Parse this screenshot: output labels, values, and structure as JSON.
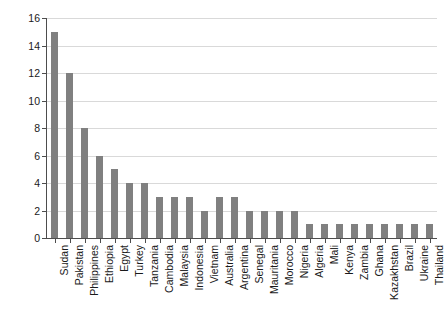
{
  "chart_data": {
    "type": "bar",
    "title": "",
    "subtitle": "",
    "xlabel": "",
    "ylabel": "",
    "ylim": [
      0,
      16
    ],
    "ytick_labels": [
      "0",
      "2",
      "4",
      "6",
      "8",
      "10",
      "12",
      "14",
      "16"
    ],
    "yticks": [
      0,
      2,
      4,
      6,
      8,
      10,
      12,
      14,
      16
    ],
    "grid": true,
    "legend": "none",
    "bar_color": "#808080",
    "axis_color": "#4d4d4d",
    "gridline_color": "#d9d9d9",
    "background_color": "#ffffff",
    "categories": [
      "Sudan",
      "Pakistan",
      "Philippines",
      "Ethiopia",
      "Egypt",
      "Turkey",
      "Tanzania",
      "Cambodia",
      "Malaysia",
      "Indonesia",
      "Vietnam",
      "Australia",
      "Argentina",
      "Senegal",
      "Mauritania",
      "Morocco",
      "Nigeria",
      "Algeria",
      "Mali",
      "Kenya",
      "Zambia",
      "Ghana",
      "Kazakhstan",
      "Brazil",
      "Ukraine",
      "Thailand"
    ],
    "values": [
      15,
      12,
      8,
      6,
      5,
      4,
      4,
      3,
      3,
      3,
      2,
      3,
      3,
      2,
      2,
      2,
      2,
      1,
      1,
      1,
      1,
      1,
      1,
      1,
      1,
      1
    ]
  }
}
